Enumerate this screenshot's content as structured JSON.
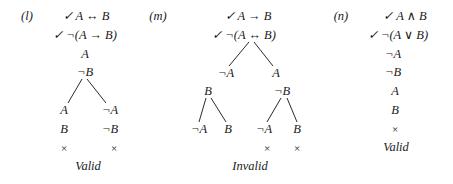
{
  "panels": [
    {
      "label": "(l)",
      "lines": [
        "✓ A ↔ B",
        "✓ ¬(A → B)",
        "A",
        "¬B"
      ],
      "branches": {
        "left": [
          "A",
          "B",
          "×"
        ],
        "right": [
          "¬A",
          "¬B",
          "×"
        ]
      },
      "verdict": "Valid"
    },
    {
      "label": "(m)",
      "lines": [
        "✓ A → B",
        "✓ ¬(A ↔ B)"
      ],
      "branches": {
        "left": "¬A",
        "right": "A",
        "left_child": "B",
        "right_child": "¬B",
        "leaves": [
          "¬A",
          "B",
          "¬A",
          "B"
        ],
        "closures": [
          "×",
          "×"
        ]
      },
      "verdict": "Invalid"
    },
    {
      "label": "(n)",
      "lines": [
        "✓ A ∧ B",
        "✓ ¬(A ∨ B)",
        "¬A",
        "¬B",
        "A",
        "B",
        "×"
      ],
      "verdict": "Valid"
    }
  ]
}
